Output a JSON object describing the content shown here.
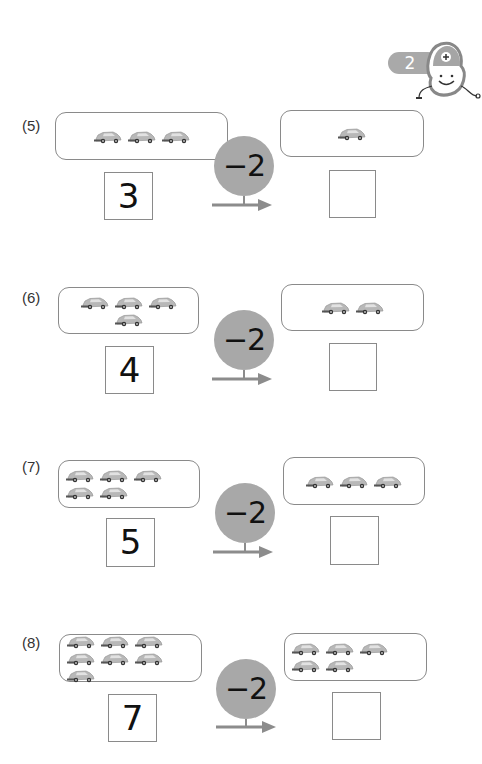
{
  "header": {
    "page_badge": "2",
    "mascot": "smiling-plus-mascot-icon"
  },
  "colors": {
    "operator_circle": "#a8a8a8",
    "border": "#8a8a8a",
    "badge": "#a9a9a9",
    "car": "#b5b5b5"
  },
  "problems": [
    {
      "label": "(5)",
      "start_count": 3,
      "start_number": "3",
      "operator": "−2",
      "result_count": 1,
      "answer": ""
    },
    {
      "label": "(6)",
      "start_count": 4,
      "start_number": "4",
      "operator": "−2",
      "result_count": 2,
      "answer": ""
    },
    {
      "label": "(7)",
      "start_count": 5,
      "start_number": "5",
      "operator": "−2",
      "result_count": 3,
      "answer": ""
    },
    {
      "label": "(8)",
      "start_count": 7,
      "start_number": "7",
      "operator": "−2",
      "result_count": 5,
      "answer": ""
    }
  ]
}
